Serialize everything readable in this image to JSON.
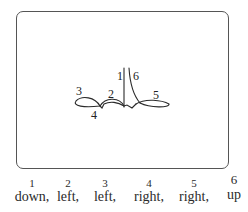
{
  "diagram": {
    "stroke_labels": [
      {
        "id": "1",
        "x": 117,
        "y": 80
      },
      {
        "id": "2",
        "x": 108,
        "y": 98
      },
      {
        "id": "3",
        "x": 76,
        "y": 95
      },
      {
        "id": "4",
        "x": 91,
        "y": 119
      },
      {
        "id": "5",
        "x": 153,
        "y": 99
      },
      {
        "id": "6",
        "x": 133,
        "y": 80
      }
    ]
  },
  "legend": {
    "items": [
      {
        "number": "1",
        "direction": "down,",
        "x": 32
      },
      {
        "number": "2",
        "direction": "left,",
        "x": 68
      },
      {
        "number": "3",
        "direction": "left,",
        "x": 105
      },
      {
        "number": "4",
        "direction": "right,",
        "x": 149
      },
      {
        "number": "5",
        "direction": "right,",
        "x": 194
      },
      {
        "number": "6",
        "direction": "up",
        "x": 234
      }
    ]
  }
}
